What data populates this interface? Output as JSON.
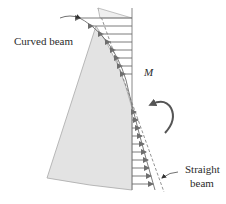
{
  "figure": {
    "labels": {
      "curved_beam": "Curved beam",
      "moment": "M",
      "straight_beam_line1": "Straight",
      "straight_beam_line2": "beam"
    },
    "colors": {
      "beam_fill": "#e3e3e3",
      "beam_edge": "#9a9a9a",
      "arrow": "#6e6e6e",
      "moment_arrow": "#555555",
      "text": "#2b2b2b"
    }
  }
}
